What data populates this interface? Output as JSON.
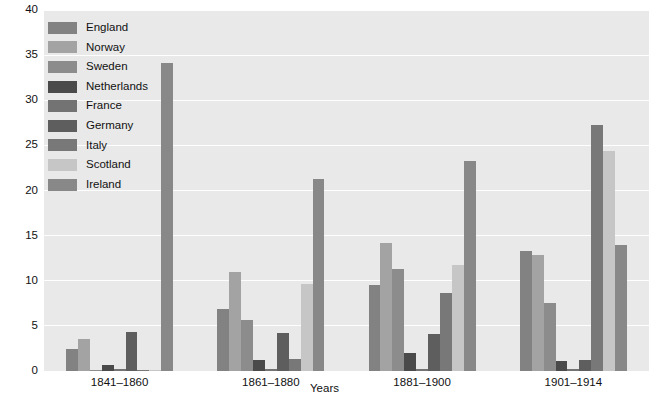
{
  "chart_data": {
    "type": "bar",
    "title": "",
    "xlabel": "Years",
    "ylabel": "",
    "ylim": [
      0,
      40
    ],
    "yticks": [
      0,
      5,
      10,
      15,
      20,
      25,
      30,
      35,
      40
    ],
    "grid": true,
    "legend_position": "top-left-inside",
    "categories": [
      "1841–1860",
      "1861–1880",
      "1881–1900",
      "1901–1914"
    ],
    "series": [
      {
        "name": "England",
        "color": "#828282",
        "values": [
          2.4,
          6.9,
          9.5,
          13.3
        ]
      },
      {
        "name": "Norway",
        "color": "#a3a3a3",
        "values": [
          3.5,
          11.0,
          14.2,
          12.8
        ]
      },
      {
        "name": "Sweden",
        "color": "#8c8c8c",
        "values": [
          0.1,
          5.6,
          11.3,
          7.5
        ]
      },
      {
        "name": "Netherlands",
        "color": "#4a4a4a",
        "values": [
          0.7,
          1.2,
          2.0,
          1.1
        ]
      },
      {
        "name": "France",
        "color": "#737373",
        "values": [
          0.2,
          0.2,
          0.2,
          0.2
        ]
      },
      {
        "name": "Germany",
        "color": "#5e5e5e",
        "values": [
          4.3,
          4.2,
          4.1,
          1.2
        ]
      },
      {
        "name": "Italy",
        "color": "#787878",
        "values": [
          0.1,
          1.3,
          8.6,
          27.3
        ]
      },
      {
        "name": "Scotland",
        "color": "#c6c6c6",
        "values": [
          0.1,
          9.6,
          11.7,
          24.4
        ]
      },
      {
        "name": "Ireland",
        "color": "#888888",
        "values": [
          34.1,
          21.3,
          23.3,
          14.0
        ]
      }
    ],
    "background_color": "#e9e9e9",
    "gridline_color": "#ffffff",
    "axis_text_color": "#111111"
  },
  "legend": {
    "items": [
      {
        "label": "England"
      },
      {
        "label": "Norway"
      },
      {
        "label": "Sweden"
      },
      {
        "label": "Netherlands"
      },
      {
        "label": "France"
      },
      {
        "label": "Germany"
      },
      {
        "label": "Italy"
      },
      {
        "label": "Scotland"
      },
      {
        "label": "Ireland"
      }
    ]
  },
  "axes": {
    "y_tick_labels": [
      "0",
      "5",
      "10",
      "15",
      "20",
      "25",
      "30",
      "35",
      "40"
    ],
    "x_tick_labels": [
      "1841–1860",
      "1861–1880",
      "1881–1900",
      "1901–1914"
    ],
    "x_title": "Years"
  }
}
